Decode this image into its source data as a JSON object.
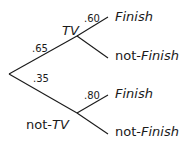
{
  "diagram": {
    "type": "probability-tree",
    "root": {
      "branches": [
        {
          "probability": ".65",
          "node_prefix": "",
          "node_label": "TV",
          "children": [
            {
              "probability": ".60",
              "prefix": "",
              "label": "Finish"
            },
            {
              "probability": "",
              "prefix": "not-",
              "label": "Finish"
            }
          ]
        },
        {
          "probability": ".35",
          "node_prefix": "not-",
          "node_label": "TV",
          "children": [
            {
              "probability": ".80",
              "prefix": "",
              "label": "Finish"
            },
            {
              "probability": "",
              "prefix": "not-",
              "label": "Finish"
            }
          ]
        }
      ]
    },
    "colors": {
      "line": "#1a1a1a",
      "text": "#1a1a1a",
      "background": "#ffffff"
    }
  }
}
